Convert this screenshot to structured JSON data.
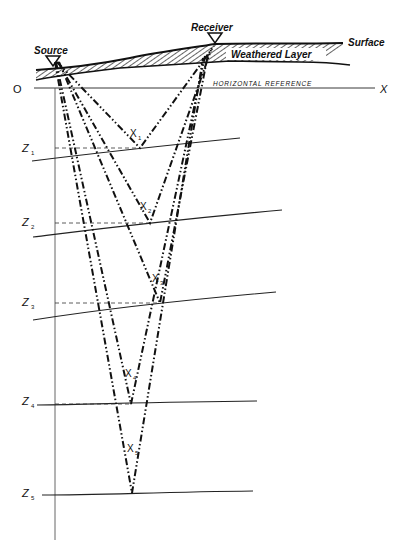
{
  "labels": {
    "source": "Source",
    "receiver": "Receiver",
    "surface": "Surface",
    "weathered_layer": "Weathered Layer",
    "horizontal_reference": "HORIZONTAL REFERENCE",
    "origin": "O",
    "x_axis": "X"
  },
  "layers": [
    {
      "depth_label": "Z",
      "sub": "1",
      "point_label": "X",
      "point_sub": "1"
    },
    {
      "depth_label": "Z",
      "sub": "2",
      "point_label": "X",
      "point_sub": "2"
    },
    {
      "depth_label": "Z",
      "sub": "3",
      "point_label": "X",
      "point_sub": "3"
    },
    {
      "depth_label": "Z",
      "sub": "4",
      "point_label": "X",
      "point_sub": "4"
    },
    {
      "depth_label": "Z",
      "sub": "5",
      "point_label": "X",
      "point_sub": "5"
    }
  ]
}
